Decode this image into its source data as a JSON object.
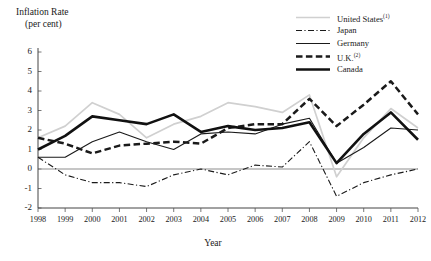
{
  "chart_data": {
    "type": "line",
    "title": "",
    "ylabel": "Inflation Rate",
    "ylabel_units": "(per cent)",
    "xlabel": "Year",
    "ylim": [
      -2,
      6
    ],
    "yticks": [
      -2,
      -1,
      0,
      1,
      2,
      3,
      4,
      5,
      6
    ],
    "ytick_labels": [
      "-2",
      "-1",
      "0",
      "1",
      "2",
      "3",
      "4",
      "5",
      "6"
    ],
    "grid": false,
    "zero_line": true,
    "legend_position": "top-right",
    "categories": [
      1998,
      1999,
      2000,
      2001,
      2002,
      2003,
      2004,
      2005,
      2006,
      2007,
      2008,
      2009,
      2010,
      2011,
      2012
    ],
    "xtick_labels": [
      "1998",
      "1999",
      "2000",
      "2001",
      "2002",
      "2003",
      "2004",
      "2005",
      "2006",
      "2007",
      "2008",
      "2009",
      "2010",
      "2011",
      "2012"
    ],
    "series": [
      {
        "name": "United States",
        "footnote": "1",
        "label": "United States",
        "style": "solid-light",
        "color": "#d0d0d0",
        "values": [
          1.6,
          2.2,
          3.4,
          2.8,
          1.6,
          2.3,
          2.7,
          3.4,
          3.2,
          2.9,
          3.8,
          -0.4,
          1.6,
          3.1,
          2.1
        ]
      },
      {
        "name": "Japan",
        "footnote": "",
        "label": "Japan",
        "style": "dash-dot",
        "color": "#1a1a1a",
        "values": [
          0.6,
          -0.3,
          -0.7,
          -0.7,
          -0.9,
          -0.3,
          0.0,
          -0.3,
          0.2,
          0.1,
          1.4,
          -1.4,
          -0.7,
          -0.3,
          0.0
        ]
      },
      {
        "name": "Germany",
        "footnote": "",
        "label": "Germany",
        "style": "solid-thin",
        "color": "#1a1a1a",
        "values": [
          0.6,
          0.6,
          1.4,
          1.9,
          1.4,
          1.0,
          1.8,
          1.9,
          1.8,
          2.3,
          2.6,
          0.3,
          1.1,
          2.1,
          2.0
        ]
      },
      {
        "name": "U.K.",
        "footnote": "2",
        "label": "U.K.",
        "style": "dashed-thick",
        "color": "#1a1a1a",
        "values": [
          1.6,
          1.3,
          0.8,
          1.2,
          1.3,
          1.4,
          1.3,
          2.1,
          2.3,
          2.3,
          3.6,
          2.2,
          3.3,
          4.5,
          2.8
        ]
      },
      {
        "name": "Canada",
        "footnote": "",
        "label": "Canada",
        "style": "solid-thick",
        "color": "#111111",
        "values": [
          1.0,
          1.7,
          2.7,
          2.5,
          2.3,
          2.8,
          1.9,
          2.2,
          2.0,
          2.1,
          2.4,
          0.3,
          1.8,
          2.9,
          1.5
        ]
      }
    ]
  }
}
